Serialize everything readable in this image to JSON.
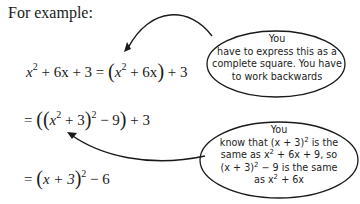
{
  "intro": "For example:",
  "equations": {
    "line1": {
      "lhs_x": "x",
      "lhs_exp": "2",
      "lhs_rest": "+ 6x + 3 =",
      "open": "(",
      "inner_x": "x",
      "inner_exp": "2",
      "inner_rest": "+ 6x",
      "close": ")",
      "tail": "+ 3"
    },
    "line2": {
      "eq": "=",
      "open1": "(",
      "open2": "(",
      "x": "x",
      "x_exp": "2",
      "plus3": "+ 3",
      "close2": ")",
      "sq_exp": "2",
      "minus9": "− 9",
      "close1": ")",
      "tail": "+ 3"
    },
    "line3": {
      "eq": "=",
      "open": "(",
      "body": "x + 3",
      "close": ")",
      "exp": "2",
      "tail": "− 6"
    }
  },
  "callouts": [
    {
      "lines": [
        "You",
        "have to express this as a",
        "complete square. You have",
        "to work backwards"
      ]
    },
    {
      "line1": "You",
      "line2_a": "know that (x + 3)",
      "line2_exp": "2",
      "line2_b": " is the",
      "line3_a": "same as x",
      "line3_exp": "2",
      "line3_b": " + 6x + 9, so",
      "line4_a": "(x + 3)",
      "line4_exp": "2",
      "line4_b": " − 9 is the same",
      "line5_a": "as x",
      "line5_exp": "2",
      "line5_b": " + 6x"
    }
  ],
  "colors": {
    "ink": "#1a1a1a",
    "background": "#ffffff"
  }
}
